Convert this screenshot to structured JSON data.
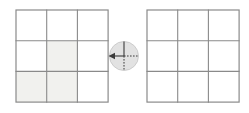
{
  "diagram": {
    "background_color": "#ffffff",
    "line_color": "#8a8a8a",
    "shade_color": "#f1f1ee",
    "dial_fill_color": "#e2e2e2",
    "dial_mark_color": "#3a3a3a"
  },
  "left_grid": {
    "label": "Left grid",
    "rows": 3,
    "columns": 3,
    "x": 16,
    "y": 10,
    "cell_size": 30.7,
    "cells": [
      {
        "row": 0,
        "col": 0,
        "shaded": false
      },
      {
        "row": 0,
        "col": 1,
        "shaded": false
      },
      {
        "row": 0,
        "col": 2,
        "shaded": false
      },
      {
        "row": 1,
        "col": 0,
        "shaded": false
      },
      {
        "row": 1,
        "col": 1,
        "shaded": true
      },
      {
        "row": 1,
        "col": 2,
        "shaded": false
      },
      {
        "row": 2,
        "col": 0,
        "shaded": true
      },
      {
        "row": 2,
        "col": 1,
        "shaded": true
      },
      {
        "row": 2,
        "col": 2,
        "shaded": false
      }
    ],
    "shaded_count": 3
  },
  "right_grid": {
    "label": "Right grid",
    "rows": 3,
    "columns": 3,
    "x": 147,
    "y": 10,
    "cell_size": 30.7,
    "cells": [
      {
        "row": 0,
        "col": 0,
        "shaded": false
      },
      {
        "row": 0,
        "col": 1,
        "shaded": false
      },
      {
        "row": 0,
        "col": 2,
        "shaded": false
      },
      {
        "row": 1,
        "col": 0,
        "shaded": false
      },
      {
        "row": 1,
        "col": 1,
        "shaded": false
      },
      {
        "row": 1,
        "col": 2,
        "shaded": false
      },
      {
        "row": 2,
        "col": 0,
        "shaded": false
      },
      {
        "row": 2,
        "col": 1,
        "shaded": false
      },
      {
        "row": 2,
        "col": 2,
        "shaded": false
      }
    ],
    "shaded_count": 0
  },
  "rotation_dial": {
    "label": "Rotation dial",
    "center_x": 124,
    "center_y": 56,
    "radius": 14.5,
    "solid_spoke": "up",
    "dashed_spokes": [
      "right",
      "down"
    ],
    "arrow_direction": "left",
    "arrow_angle_degrees": 180
  }
}
